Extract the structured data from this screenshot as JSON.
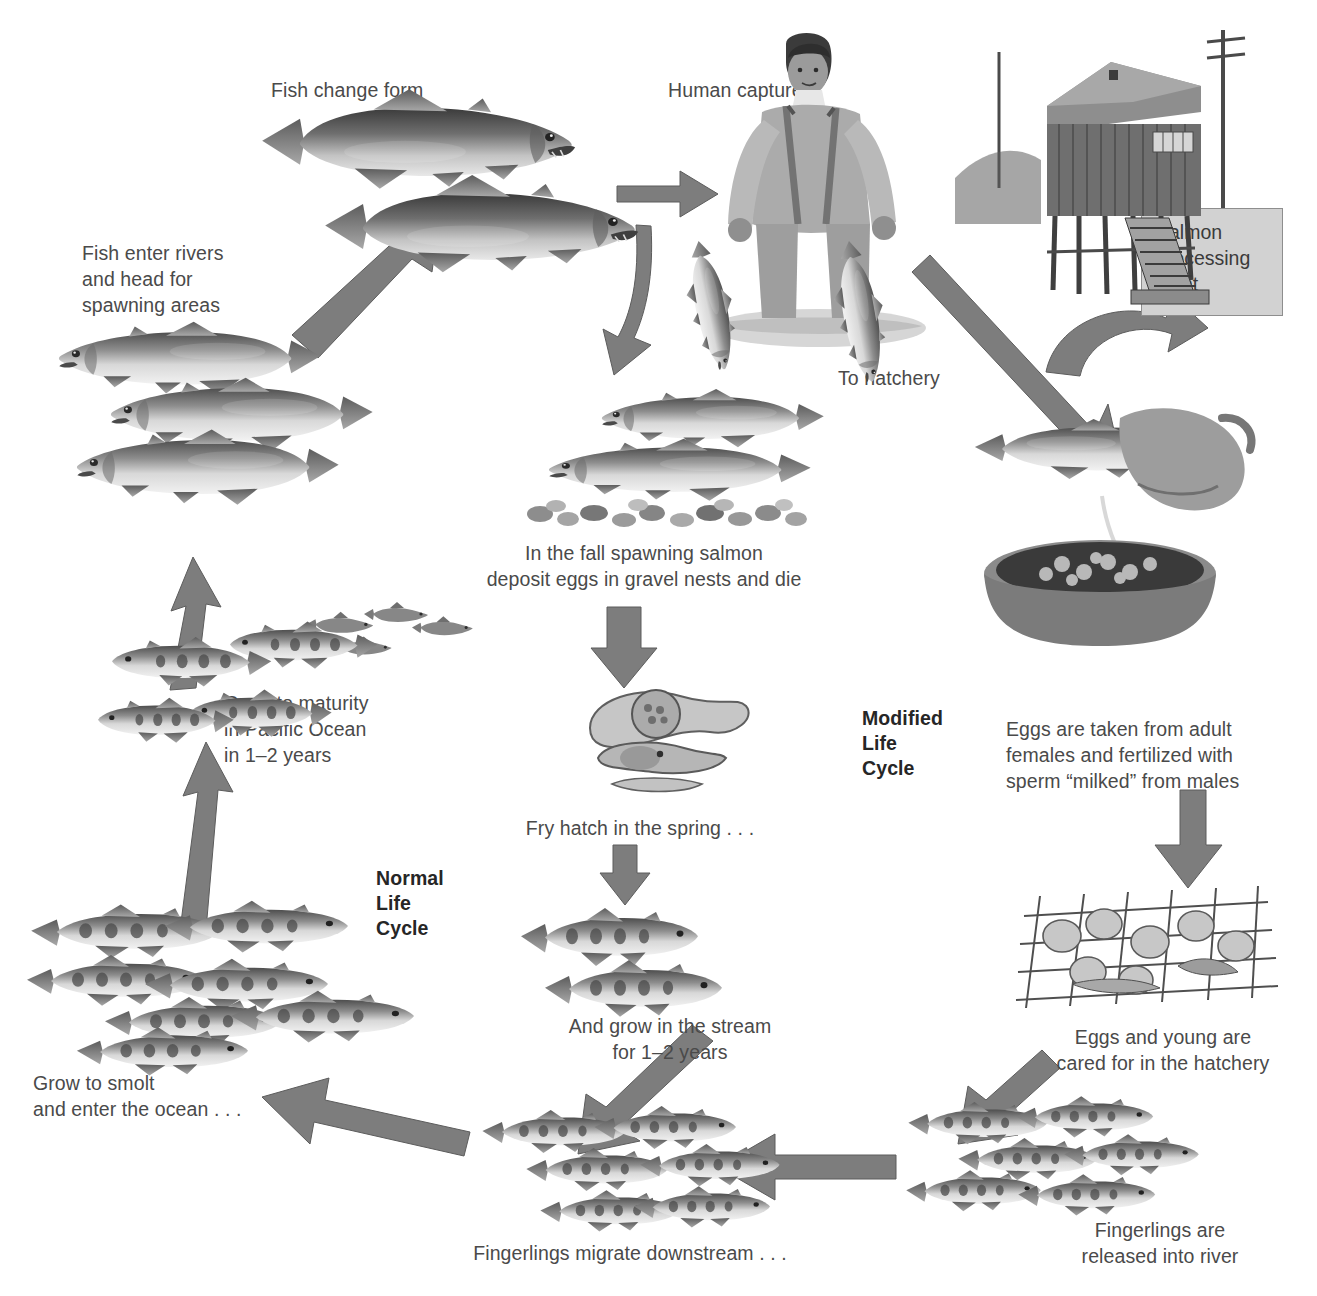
{
  "diagram": {
    "arrow_color": "#7d7d7d",
    "arrow_edge_color": "#5e5e5e",
    "text_color": "#4a4a4a",
    "sign_fill": "#d2d2d2",
    "background": "#ffffff"
  },
  "labels": {
    "fish_change_form": "Fish change form",
    "human_capture": "Human capture",
    "fish_enter_rivers": "Fish enter rivers\nand head for\nspawning areas",
    "to_hatchery": "To hatchery",
    "salmon_processing_plant": "Salmon\nprocessing\nplant",
    "fall_spawning": "In the fall spawning salmon\ndeposit eggs in gravel nests and die",
    "grow_to_maturity": "Grow to maturity\nin Pacific Ocean\nin 1–2 years",
    "eggs_taken": "Eggs are taken from adult\nfemales and fertilized with\nsperm “milked” from males",
    "fry_hatch": "Fry hatch in the spring . . .",
    "normal_life_cycle": "Normal\nLife\nCycle",
    "modified_life_cycle": "Modified\nLife\nCycle",
    "and_grow_stream": "And grow in the stream\nfor 1–2 years",
    "eggs_and_young": "Eggs and young are\ncared for in the hatchery",
    "grow_to_smolt": "Grow to smolt\nand enter the ocean . . .",
    "fingerlings_migrate": "Fingerlings migrate downstream . . .",
    "fingerlings_released": "Fingerlings are\nreleased into river"
  },
  "illustrations": {
    "spawning_adults_top": "two-spawning-phase-salmon",
    "fisherman": "man-in-waders-holding-two-salmon",
    "hatchery_building": "stilt-building-hatchery-on-pilings",
    "river_salmon_group": "three-silver-salmon-swimming-left",
    "gravel_nest_pair": "two-salmon-over-gravel-redd",
    "milking_hand": "hand-stripping-eggs-from-salmon-into-basin",
    "egg_embryos": "alevin-and-egg-development-stages",
    "parr_pair": "two-parr-fry-with-parr-marks",
    "hatchery_tray": "eggs-and-alevins-on-hatchery-tray",
    "ocean_smolts": "school-of-smolts-in-ocean",
    "smolt_school": "school-of-smolts-bottom-left",
    "fingerling_school_center": "school-of-fingerlings-migrating",
    "fingerling_school_right": "school-of-released-fingerlings"
  }
}
